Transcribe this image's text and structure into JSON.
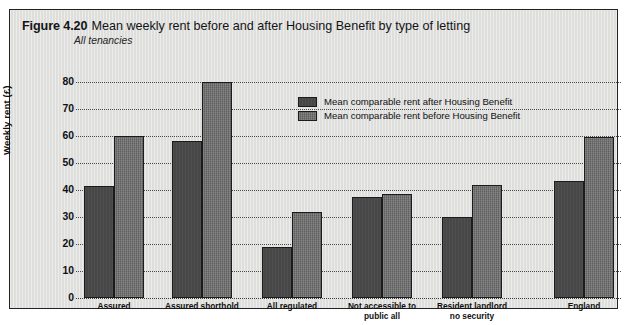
{
  "figure": {
    "number": "Figure 4.20",
    "title": "Mean weekly rent before and after Housing Benefit by type of letting",
    "subtitle": "All tenancies"
  },
  "colors": {
    "panel_background": "#dededd",
    "panel_border": "#232323",
    "series_after": "#474747",
    "series_before": "#5e5e5e",
    "gridline": "#4b4b4b",
    "text": "#111111"
  },
  "chart_data": {
    "type": "bar",
    "title": "Mean weekly rent before and after Housing Benefit by type of letting",
    "subtitle": "All tenancies",
    "xlabel": "",
    "ylabel": "Weekly rent (£)",
    "ylim": [
      0,
      80
    ],
    "yticks": [
      0,
      10,
      20,
      30,
      40,
      50,
      60,
      70,
      80
    ],
    "ytick_labels": [
      "0",
      "10",
      "20",
      "30",
      "40",
      "50",
      "60",
      "70",
      "80"
    ],
    "grid": true,
    "grid_axis": "y",
    "legend_position": "upper center",
    "categories": [
      "Assured",
      "Assured shorthold",
      "All regulated",
      "Not accessible to\npublic all",
      "Resident landlord\nno security",
      "England"
    ],
    "category_lines": [
      [
        "Assured"
      ],
      [
        "Assured shorthold"
      ],
      [
        "All regulated"
      ],
      [
        "Not accessible to",
        "public all"
      ],
      [
        "Resident landlord",
        "no security"
      ],
      [
        "England"
      ]
    ],
    "series": [
      {
        "name": "Mean comparable rent after Housing Benefit",
        "values": [
          41.5,
          58,
          19,
          37.5,
          30,
          43.5
        ]
      },
      {
        "name": "Mean comparable rent before Housing Benefit",
        "values": [
          60,
          80,
          32,
          38.5,
          42,
          59.5
        ]
      }
    ]
  },
  "legend": {
    "items": [
      {
        "label": "Mean comparable rent after Housing Benefit",
        "series": "after"
      },
      {
        "label": "Mean comparable rent before Housing Benefit",
        "series": "before"
      }
    ]
  }
}
